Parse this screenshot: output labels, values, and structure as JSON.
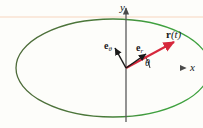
{
  "figure": {
    "background_color": "#fdfdfa"
  },
  "axes": {
    "x_label": "x",
    "y_label": "y",
    "x_axis_color": "#8a7f96",
    "y_axis_color": "#5a5a5a",
    "origin": {
      "x": 126,
      "y": 68
    }
  },
  "curve": {
    "name": "ellipse-path",
    "color_left": "#4e6b3a",
    "color_right": "#3fa13f",
    "center_x": 113,
    "center_y": 68,
    "radius_x": 97,
    "radius_y": 49
  },
  "guide_line": {
    "name": "faint-horizontal-rule",
    "color": "#f7dfcf",
    "y": 17
  },
  "vectors": [
    {
      "id": "r-vector",
      "label": "r(t)",
      "label_bold_part": "r",
      "label_paren_part": "(t)",
      "color": "#d6283c",
      "from_x": 126,
      "from_y": 68,
      "to_x": 178,
      "to_y": 40
    },
    {
      "id": "e-r-vector",
      "label": "e",
      "subscript": "r",
      "color": "#1a1a1a",
      "from_x": 126,
      "from_y": 68,
      "to_x": 148,
      "to_y": 52
    },
    {
      "id": "e-theta-vector",
      "label": "e",
      "subscript": "θ",
      "color": "#1a1a1a",
      "from_x": 126,
      "from_y": 68,
      "to_x": 114,
      "to_y": 46
    }
  ],
  "angle": {
    "symbol": "θ",
    "arc_color": "#1a1a1a",
    "arc_radius": 22
  }
}
